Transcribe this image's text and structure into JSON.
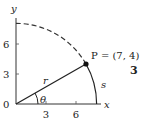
{
  "chart_data": {
    "type": "diagram",
    "title": "",
    "xlabel": "x",
    "ylabel": "y",
    "x_ticks": [
      "3",
      "6"
    ],
    "x_tick_values": [
      3,
      6
    ],
    "y_ticks": [
      "0",
      "3",
      "6"
    ],
    "y_tick_values": [
      0,
      3,
      6
    ],
    "origin_label": "0",
    "point": {
      "x": 7,
      "y": 4,
      "label": "P = (7, 4)"
    },
    "radius_label": "r",
    "angle_label": "θ",
    "arc_label": "s",
    "figure_number": "3",
    "xlim": [
      0,
      8.3
    ],
    "ylim": [
      0,
      8.5
    ]
  }
}
